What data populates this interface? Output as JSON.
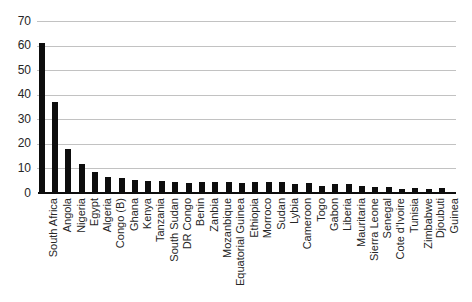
{
  "chart_data": {
    "type": "bar",
    "title": "",
    "xlabel": "",
    "ylabel": "",
    "categories": [
      "South Africa",
      "Angola",
      "Nigeria",
      "Egypt",
      "Algeria",
      "Congo (B)",
      "Ghana",
      "Kenya",
      "Tanzania",
      "South Sudan",
      "DR Congo",
      "Benin",
      "Zanbia",
      "Mozanbique",
      "Equatorial Guinea",
      "Ethiopia",
      "Morroco",
      "Sudan",
      "Lybia",
      "Cameroon",
      "Togo",
      "Gabon",
      "Liberia",
      "Mauritaria",
      "Sierra Leone",
      "Senegal",
      "Cote d'Ivoire",
      "Tunisia",
      "Zimbabwe",
      "Djoubuti",
      "Guinea"
    ],
    "values": [
      61,
      37,
      18,
      12,
      8.5,
      6.5,
      6,
      5.5,
      5,
      5,
      4.5,
      4,
      4.5,
      4.5,
      4.5,
      4,
      4.5,
      4.5,
      4.5,
      3.5,
      4,
      3,
      3.5,
      3.5,
      3,
      2.5,
      2.5,
      1.5,
      2,
      1.5,
      2
    ],
    "ylim": [
      0,
      70
    ],
    "yticks": [
      0,
      10,
      20,
      30,
      40,
      50,
      60,
      70
    ],
    "grid": true,
    "legend_position": "none",
    "bar_color": "#0d0d0d",
    "gridline_color": "#c2c2c2",
    "axis_line_color": "#0d0d0d",
    "text_color": "#262626",
    "background_color": "#ffffff"
  }
}
